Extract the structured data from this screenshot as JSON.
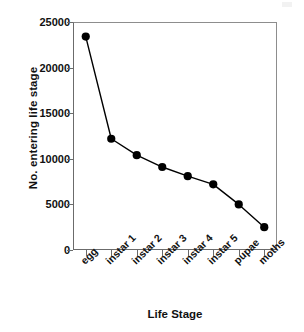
{
  "chart_data": {
    "type": "line",
    "title": "",
    "xlabel": "Life Stage",
    "ylabel": "No. entering life stage",
    "categories": [
      "egg",
      "instar 1",
      "instar 2",
      "instar 3",
      "instar 4",
      "instar 5",
      "pupae",
      "moths"
    ],
    "values": [
      23400,
      12200,
      10400,
      9100,
      8100,
      7200,
      5000,
      2500
    ],
    "series": [
      {
        "name": "No. entering life stage",
        "values": [
          23400,
          12200,
          10400,
          9100,
          8100,
          7200,
          5000,
          2500
        ]
      }
    ],
    "ylim": [
      0,
      25000
    ],
    "yticks": [
      0,
      5000,
      10000,
      15000,
      20000,
      25000
    ],
    "ytick_labels": [
      "0",
      "5000",
      "10000",
      "15000",
      "20000",
      "25000"
    ],
    "grid": false,
    "legend": false,
    "legend_position": "none",
    "marker": "filled-circle",
    "marker_color": "#000000",
    "line_color": "#000000",
    "xtick_label_rotation": -45
  },
  "axes": {
    "y_title": "No. entering life stage",
    "x_title": "Life Stage"
  }
}
